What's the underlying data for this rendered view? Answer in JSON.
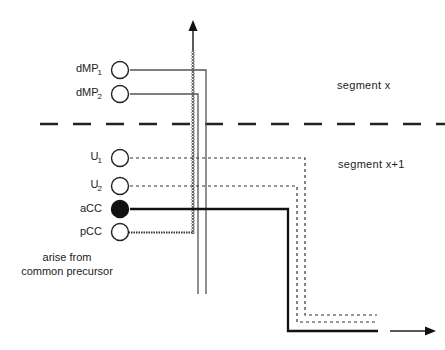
{
  "diagram": {
    "neurons": [
      {
        "id": "dMP1",
        "label": "dMP",
        "sub": "1",
        "fill": "open",
        "line": "thin-solid"
      },
      {
        "id": "dMP2",
        "label": "dMP",
        "sub": "2",
        "fill": "open",
        "line": "thin-solid"
      },
      {
        "id": "U1",
        "label": "U",
        "sub": "1",
        "fill": "open",
        "line": "dashed"
      },
      {
        "id": "U2",
        "label": "U",
        "sub": "2",
        "fill": "open",
        "line": "dashed"
      },
      {
        "id": "aCC",
        "label": "aCC",
        "sub": "",
        "fill": "filled",
        "line": "thick-solid"
      },
      {
        "id": "pCC",
        "label": "pCC",
        "sub": "",
        "fill": "open",
        "line": "wavy"
      }
    ],
    "segments": {
      "upper": "segment  x",
      "lower": "segment  x+1"
    },
    "note": {
      "line1": "arise  from",
      "line2": "common  precursor"
    },
    "arrows": [
      "up-arrow-anterior",
      "right-arrow-exit"
    ],
    "colors": {
      "line": "#222222",
      "thin_line": "#555555",
      "background": "#ffffff"
    }
  }
}
